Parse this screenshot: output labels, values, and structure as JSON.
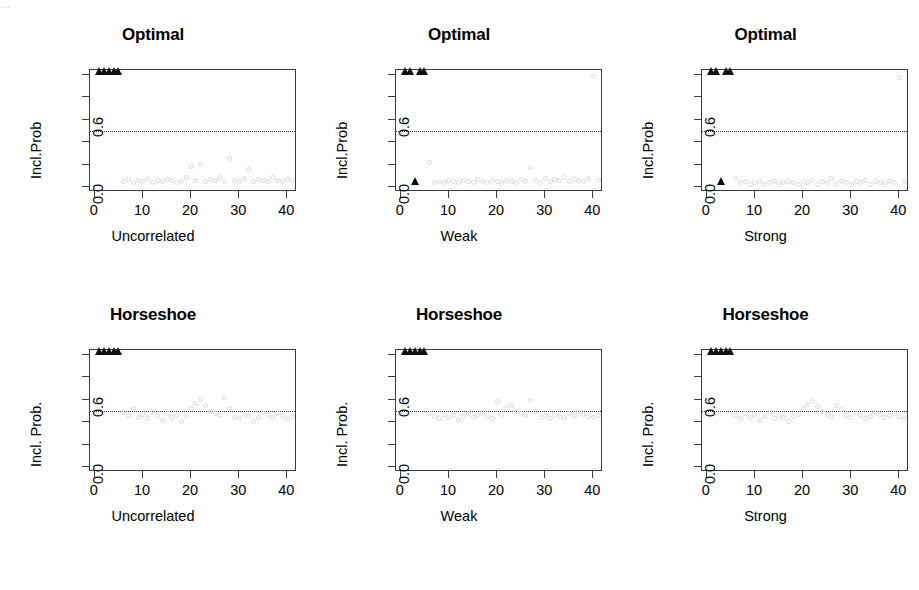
{
  "figure": {
    "top_cropped_text": "...",
    "background": "#ffffff",
    "point_color": "#d9d9de",
    "marker_color": "#101014",
    "axis_color": "#3b3b42",
    "rows": 2,
    "cols": 3
  },
  "chart_data": [
    {
      "type": "scatter",
      "title": "Optimal",
      "xlabel": "Uncorrelated",
      "ylabel": "Incl.Prob",
      "xlim": [
        -1,
        42
      ],
      "ylim": [
        -0.04,
        1.04
      ],
      "xticks": [
        0,
        10,
        20,
        30,
        40
      ],
      "xticklabels": [
        "0",
        "10",
        "20",
        "30",
        "40"
      ],
      "yticks": [
        0.0,
        0.2,
        0.4,
        0.6,
        0.8,
        1.0
      ],
      "yticklabels": [
        "0.0",
        "",
        "",
        "0.6",
        "",
        ""
      ],
      "grid": false,
      "legend": null,
      "threshold_line": {
        "y": 0.5,
        "style": "dotted"
      },
      "series": [
        {
          "name": "true-signals",
          "marker": "triangle",
          "color": "#101014",
          "x": [
            1,
            2,
            3,
            4,
            5
          ],
          "y": [
            1.0,
            1.0,
            1.0,
            1.0,
            1.0
          ]
        },
        {
          "name": "noise-variables",
          "marker": "circle",
          "color": "#d9d9de",
          "x": [
            6,
            7,
            8,
            9,
            10,
            11,
            12,
            13,
            14,
            15,
            16,
            17,
            18,
            19,
            20,
            21,
            22,
            23,
            24,
            25,
            26,
            27,
            28,
            29,
            30,
            31,
            32,
            33,
            34,
            35,
            36,
            37,
            38,
            39,
            40,
            41
          ],
          "y": [
            0.05,
            0.07,
            0.04,
            0.06,
            0.05,
            0.08,
            0.04,
            0.06,
            0.05,
            0.07,
            0.06,
            0.04,
            0.05,
            0.09,
            0.19,
            0.06,
            0.2,
            0.05,
            0.07,
            0.06,
            0.09,
            0.05,
            0.26,
            0.06,
            0.05,
            0.08,
            0.16,
            0.05,
            0.07,
            0.06,
            0.05,
            0.09,
            0.06,
            0.05,
            0.07,
            0.06
          ]
        }
      ]
    },
    {
      "type": "scatter",
      "title": "Optimal",
      "xlabel": "Weak",
      "ylabel": "Incl.Prob",
      "xlim": [
        -1,
        42
      ],
      "ylim": [
        -0.04,
        1.04
      ],
      "xticks": [
        0,
        10,
        20,
        30,
        40
      ],
      "xticklabels": [
        "0",
        "10",
        "20",
        "30",
        "40"
      ],
      "yticks": [
        0.0,
        0.2,
        0.4,
        0.6,
        0.8,
        1.0
      ],
      "yticklabels": [
        "0.0",
        "",
        "",
        "0.6",
        "",
        ""
      ],
      "grid": false,
      "legend": null,
      "threshold_line": {
        "y": 0.5,
        "style": "dotted"
      },
      "series": [
        {
          "name": "true-signals-selected",
          "marker": "triangle",
          "color": "#101014",
          "x": [
            1,
            2,
            4,
            5
          ],
          "y": [
            1.0,
            1.0,
            1.0,
            1.0
          ]
        },
        {
          "name": "true-signal-missed",
          "marker": "triangle",
          "color": "#101014",
          "x": [
            3
          ],
          "y": [
            0.02
          ]
        },
        {
          "name": "noise-variables",
          "marker": "circle",
          "color": "#d9d9de",
          "x": [
            6,
            7,
            8,
            9,
            10,
            11,
            12,
            13,
            14,
            15,
            16,
            17,
            18,
            19,
            20,
            21,
            22,
            23,
            24,
            25,
            26,
            27,
            28,
            29,
            30,
            31,
            32,
            33,
            34,
            35,
            36,
            37,
            38,
            39,
            40,
            41
          ],
          "y": [
            0.22,
            0.04,
            0.05,
            0.04,
            0.06,
            0.05,
            0.04,
            0.06,
            0.05,
            0.04,
            0.07,
            0.05,
            0.04,
            0.06,
            0.05,
            0.04,
            0.06,
            0.05,
            0.04,
            0.07,
            0.05,
            0.18,
            0.06,
            0.04,
            0.08,
            0.05,
            0.07,
            0.06,
            0.09,
            0.05,
            0.07,
            0.06,
            0.05,
            0.08,
            0.98,
            0.06
          ]
        }
      ]
    },
    {
      "type": "scatter",
      "title": "Optimal",
      "xlabel": "Strong",
      "ylabel": "Incl.Prob",
      "xlim": [
        -1,
        42
      ],
      "ylim": [
        -0.04,
        1.04
      ],
      "xticks": [
        0,
        10,
        20,
        30,
        40
      ],
      "xticklabels": [
        "0",
        "10",
        "20",
        "30",
        "40"
      ],
      "yticks": [
        0.0,
        0.2,
        0.4,
        0.6,
        0.8,
        1.0
      ],
      "yticklabels": [
        "0.0",
        "",
        "",
        "0.6",
        "",
        ""
      ],
      "grid": false,
      "legend": null,
      "threshold_line": {
        "y": 0.5,
        "style": "dotted"
      },
      "series": [
        {
          "name": "true-signals-selected",
          "marker": "triangle",
          "color": "#101014",
          "x": [
            1,
            2,
            4,
            5
          ],
          "y": [
            1.0,
            1.0,
            1.0,
            1.0
          ]
        },
        {
          "name": "true-signal-missed",
          "marker": "triangle",
          "color": "#101014",
          "x": [
            3
          ],
          "y": [
            0.02
          ]
        },
        {
          "name": "noise-variables",
          "marker": "circle",
          "color": "#d9d9de",
          "x": [
            6,
            7,
            8,
            9,
            10,
            11,
            12,
            13,
            14,
            15,
            16,
            17,
            18,
            19,
            20,
            21,
            22,
            23,
            24,
            25,
            26,
            27,
            28,
            29,
            30,
            31,
            32,
            33,
            34,
            35,
            36,
            37,
            38,
            39,
            40,
            41
          ],
          "y": [
            0.08,
            0.04,
            0.05,
            0.03,
            0.04,
            0.05,
            0.03,
            0.04,
            0.05,
            0.03,
            0.04,
            0.05,
            0.04,
            0.03,
            0.05,
            0.04,
            0.06,
            0.03,
            0.05,
            0.04,
            0.08,
            0.03,
            0.05,
            0.04,
            0.03,
            0.05,
            0.04,
            0.06,
            0.03,
            0.05,
            0.04,
            0.03,
            0.05,
            0.04,
            0.97,
            0.05
          ]
        }
      ]
    },
    {
      "type": "scatter",
      "title": "Horseshoe",
      "xlabel": "Uncorrelated",
      "ylabel": "Incl. Prob.",
      "xlim": [
        -1,
        42
      ],
      "ylim": [
        -0.04,
        1.04
      ],
      "xticks": [
        0,
        10,
        20,
        30,
        40
      ],
      "xticklabels": [
        "0",
        "10",
        "20",
        "30",
        "40"
      ],
      "yticks": [
        0.0,
        0.2,
        0.4,
        0.6,
        0.8,
        1.0
      ],
      "yticklabels": [
        "0.0",
        "",
        "",
        "0.6",
        "",
        ""
      ],
      "grid": false,
      "legend": null,
      "threshold_line": {
        "y": 0.5,
        "style": "dotted"
      },
      "series": [
        {
          "name": "true-signals",
          "marker": "triangle",
          "color": "#101014",
          "x": [
            1,
            2,
            3,
            4,
            5
          ],
          "y": [
            1.0,
            1.0,
            1.0,
            1.0,
            1.0
          ]
        },
        {
          "name": "noise-variables",
          "marker": "circle",
          "color": "#d9d9de",
          "x": [
            6,
            7,
            8,
            9,
            10,
            11,
            12,
            13,
            14,
            15,
            16,
            17,
            18,
            19,
            20,
            21,
            22,
            23,
            24,
            25,
            26,
            27,
            28,
            29,
            30,
            31,
            32,
            33,
            34,
            35,
            36,
            37,
            38,
            39,
            40,
            41
          ],
          "y": [
            0.49,
            0.46,
            0.52,
            0.44,
            0.47,
            0.43,
            0.5,
            0.45,
            0.42,
            0.48,
            0.44,
            0.46,
            0.41,
            0.45,
            0.52,
            0.57,
            0.6,
            0.55,
            0.5,
            0.48,
            0.46,
            0.62,
            0.52,
            0.44,
            0.43,
            0.47,
            0.45,
            0.41,
            0.44,
            0.49,
            0.47,
            0.44,
            0.48,
            0.46,
            0.43,
            0.45
          ]
        }
      ]
    },
    {
      "type": "scatter",
      "title": "Horseshoe",
      "xlabel": "Weak",
      "ylabel": "Incl. Prob.",
      "xlim": [
        -1,
        42
      ],
      "ylim": [
        -0.04,
        1.04
      ],
      "xticks": [
        0,
        10,
        20,
        30,
        40
      ],
      "xticklabels": [
        "0",
        "10",
        "20",
        "30",
        "40"
      ],
      "yticks": [
        0.0,
        0.2,
        0.4,
        0.6,
        0.8,
        1.0
      ],
      "yticklabels": [
        "0.0",
        "",
        "",
        "0.6",
        "",
        ""
      ],
      "grid": false,
      "legend": null,
      "threshold_line": {
        "y": 0.5,
        "style": "dotted"
      },
      "series": [
        {
          "name": "true-signals",
          "marker": "triangle",
          "color": "#101014",
          "x": [
            1,
            2,
            3,
            4,
            5
          ],
          "y": [
            1.0,
            1.0,
            1.0,
            1.0,
            1.0
          ]
        },
        {
          "name": "noise-variables",
          "marker": "circle",
          "color": "#d9d9de",
          "x": [
            6,
            7,
            8,
            9,
            10,
            11,
            12,
            13,
            14,
            15,
            16,
            17,
            18,
            19,
            20,
            21,
            22,
            23,
            24,
            25,
            26,
            27,
            28,
            29,
            30,
            31,
            32,
            33,
            34,
            35,
            36,
            37,
            38,
            39,
            40,
            41
          ],
          "y": [
            0.48,
            0.45,
            0.43,
            0.47,
            0.44,
            0.46,
            0.42,
            0.45,
            0.48,
            0.44,
            0.46,
            0.49,
            0.45,
            0.43,
            0.58,
            0.47,
            0.52,
            0.55,
            0.5,
            0.48,
            0.46,
            0.59,
            0.5,
            0.44,
            0.46,
            0.43,
            0.47,
            0.45,
            0.44,
            0.48,
            0.46,
            0.5,
            0.47,
            0.45,
            0.44,
            0.46
          ]
        }
      ]
    },
    {
      "type": "scatter",
      "title": "Horseshoe",
      "xlabel": "Strong",
      "ylabel": "Incl. Prob.",
      "xlim": [
        -1,
        42
      ],
      "ylim": [
        -0.04,
        1.04
      ],
      "xticks": [
        0,
        10,
        20,
        30,
        40
      ],
      "xticklabels": [
        "0",
        "10",
        "20",
        "30",
        "40"
      ],
      "yticks": [
        0.0,
        0.2,
        0.4,
        0.6,
        0.8,
        1.0
      ],
      "yticklabels": [
        "0.0",
        "",
        "",
        "0.6",
        "",
        ""
      ],
      "grid": false,
      "legend": null,
      "threshold_line": {
        "y": 0.5,
        "style": "dotted"
      },
      "series": [
        {
          "name": "true-signals",
          "marker": "triangle",
          "color": "#101014",
          "x": [
            1,
            2,
            3,
            4,
            5
          ],
          "y": [
            1.0,
            1.0,
            1.0,
            1.0,
            1.0
          ]
        },
        {
          "name": "noise-variables",
          "marker": "circle",
          "color": "#d9d9de",
          "x": [
            6,
            7,
            8,
            9,
            10,
            11,
            12,
            13,
            14,
            15,
            16,
            17,
            18,
            19,
            20,
            21,
            22,
            23,
            24,
            25,
            26,
            27,
            28,
            29,
            30,
            31,
            32,
            33,
            34,
            35,
            36,
            37,
            38,
            39,
            40,
            41
          ],
          "y": [
            0.46,
            0.43,
            0.48,
            0.44,
            0.47,
            0.42,
            0.45,
            0.49,
            0.43,
            0.46,
            0.44,
            0.41,
            0.45,
            0.47,
            0.52,
            0.56,
            0.58,
            0.54,
            0.5,
            0.47,
            0.45,
            0.55,
            0.51,
            0.46,
            0.44,
            0.48,
            0.46,
            0.43,
            0.45,
            0.49,
            0.47,
            0.44,
            0.46,
            0.48,
            0.45,
            0.43
          ]
        }
      ]
    }
  ]
}
